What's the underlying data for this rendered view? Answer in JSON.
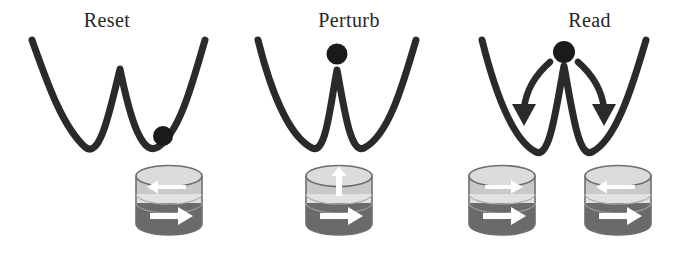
{
  "figure": {
    "type": "diagram",
    "background_color": "#ffffff",
    "width": 697,
    "height": 256,
    "sequence": [
      "Reset",
      "Perturb",
      "Read"
    ]
  },
  "style": {
    "curve_color": "#2a2a2a",
    "curve_width": 7,
    "ball_color": "#1a1a1a",
    "arrow_color": "#2a2a2a",
    "cylinder_outline": "#6e6e6e",
    "cylinder_top_cap": "#dcdcdc",
    "cylinder_free_layer": "#c9c9c9",
    "cylinder_barrier": "#e2e2e2",
    "cylinder_fixed_layer": "#6a6a6a",
    "magnet_arrow_color": "#ffffff",
    "title_color": "#262626"
  },
  "panels": [
    {
      "id": "reset",
      "title": "Reset",
      "ball": {
        "position": "right-well",
        "state": "settled"
      },
      "transition_arrows": [],
      "stacks": [
        {
          "id": "reset-stack",
          "free_layer_arrow": "left",
          "barrier_arrow": "none",
          "fixed_layer_arrow": "right",
          "state": "antiparallel"
        }
      ]
    },
    {
      "id": "perturb",
      "title": "Perturb",
      "ball": {
        "position": "barrier-top",
        "state": "unstable"
      },
      "transition_arrows": [],
      "stacks": [
        {
          "id": "perturb-stack",
          "free_layer_arrow": "up",
          "barrier_arrow": "none",
          "fixed_layer_arrow": "right",
          "state": "perpendicular"
        }
      ]
    },
    {
      "id": "read",
      "title": "Read",
      "ball": {
        "position": "barrier-top",
        "state": "splitting"
      },
      "transition_arrows": [
        "curve-down-left",
        "curve-down-right"
      ],
      "stacks": [
        {
          "id": "read-stack-parallel",
          "free_layer_arrow": "right",
          "barrier_arrow": "none",
          "fixed_layer_arrow": "right",
          "state": "parallel"
        },
        {
          "id": "read-stack-antiparallel",
          "free_layer_arrow": "left",
          "barrier_arrow": "none",
          "fixed_layer_arrow": "right",
          "state": "antiparallel"
        }
      ]
    }
  ]
}
